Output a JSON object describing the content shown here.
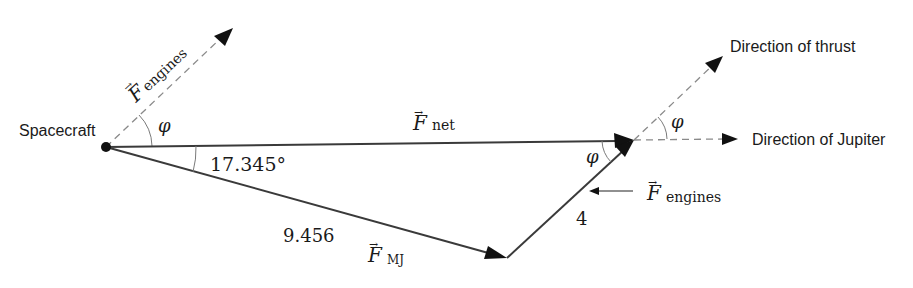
{
  "diagram": {
    "labels": {
      "spacecraft": "Spacecraft",
      "direction_of_thrust": "Direction of thrust",
      "direction_of_jupiter": "Direction of Jupiter",
      "f_engines_upper": "F",
      "f_engines_upper_sub": "engines",
      "f_net": "F",
      "f_net_sub": "net",
      "f_mj": "F",
      "f_mj_sub": "MJ",
      "f_engines_lower": "F",
      "f_engines_lower_sub": "engines",
      "angle_17": "17.345°",
      "phi_spacecraft": "φ",
      "phi_triangle": "φ",
      "phi_thrust": "φ",
      "magnitude_mj": "9.456",
      "magnitude_engines": "4",
      "vector_mark": "→"
    },
    "vectors": [
      {
        "name": "F_net",
        "from": "spacecraft",
        "to": "net_tip",
        "style": "solid"
      },
      {
        "name": "F_MJ",
        "from": "spacecraft",
        "to": "mj_tip",
        "magnitude": 9.456,
        "style": "solid"
      },
      {
        "name": "F_engines",
        "from": "mj_tip",
        "to": "net_tip",
        "magnitude": 4,
        "style": "solid"
      },
      {
        "name": "F_engines (direction)",
        "from": "spacecraft",
        "style": "dashed"
      },
      {
        "name": "Direction of thrust",
        "from": "net_tip",
        "style": "dashed"
      },
      {
        "name": "Direction of Jupiter",
        "from": "net_tip",
        "style": "dashed"
      }
    ],
    "angles": [
      {
        "label": "17.345°",
        "between": [
          "F_net",
          "F_MJ"
        ]
      },
      {
        "label": "φ",
        "between": [
          "F_engines direction",
          "F_net"
        ]
      },
      {
        "label": "φ",
        "between": [
          "F_net",
          "F_engines"
        ]
      },
      {
        "label": "φ",
        "between": [
          "Direction of Jupiter",
          "Direction of thrust"
        ]
      }
    ],
    "colors": {
      "background": "#ffffff",
      "solid_line": "#3a3a3a",
      "dashed_line": "#8a8a8a",
      "text": "#1a1a1a"
    }
  }
}
